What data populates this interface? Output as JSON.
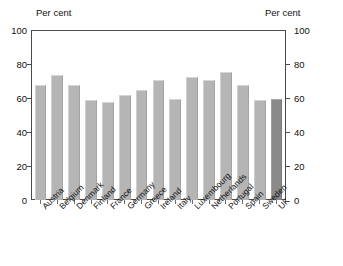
{
  "figure": {
    "title_remnant": "",
    "background_color": "#ffffff",
    "frame_color": "#4a4a4a"
  },
  "axis": {
    "left_header": "Per cent",
    "right_header": "Per cent",
    "tick_labels": [
      "100",
      "80",
      "60",
      "40",
      "20",
      "0"
    ]
  },
  "colors": {
    "bar": "#b5b5b5",
    "bar_highlight": "#8a8a8a",
    "text": "#111111"
  },
  "chart_data": {
    "type": "bar",
    "title": "",
    "xlabel": "",
    "ylabel": "Per cent",
    "ylim": [
      0,
      100
    ],
    "yticks": [
      0,
      20,
      40,
      60,
      80,
      100
    ],
    "grid": false,
    "legend": "none",
    "dual_axis": true,
    "highlight_category": "UK",
    "categories": [
      "Austria",
      "Belgium",
      "Denmark",
      "Finland",
      "France",
      "Germany",
      "Greece",
      "Ireland",
      "Italy",
      "Luxembourg",
      "Netherlands",
      "Portugal",
      "Spain",
      "Sweden",
      "UK"
    ],
    "values": [
      68,
      74,
      68,
      59,
      58,
      62,
      65,
      71,
      60,
      73,
      71,
      76,
      68,
      59,
      60
    ]
  }
}
